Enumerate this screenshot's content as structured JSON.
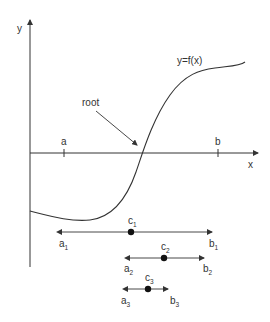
{
  "diagram": {
    "axes": {
      "x_label": "x",
      "y_label": "y"
    },
    "curve_label": "y=f(x)",
    "annotation": "root",
    "ticks": {
      "a": "a",
      "b": "b"
    },
    "intervals": [
      {
        "a": "a",
        "a_sub": "1",
        "b": "b",
        "b_sub": "1",
        "c": "c",
        "c_sub": "1"
      },
      {
        "a": "a",
        "a_sub": "2",
        "b": "b",
        "b_sub": "2",
        "c": "c",
        "c_sub": "2"
      },
      {
        "a": "a",
        "a_sub": "3",
        "b": "b",
        "b_sub": "3",
        "c": "c",
        "c_sub": "3"
      }
    ],
    "colors": {
      "line": "#333333",
      "background": "#ffffff"
    }
  }
}
